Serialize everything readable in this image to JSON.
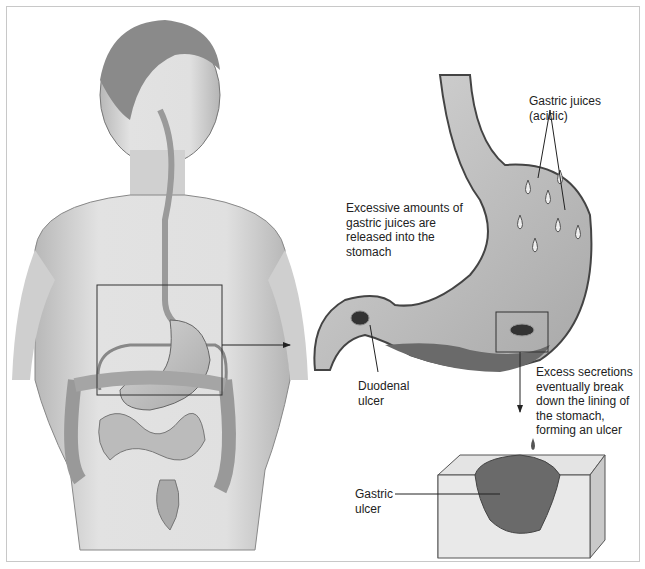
{
  "diagram": {
    "labels": {
      "gastric_juices": [
        "Gastric juices",
        "(acidic)"
      ],
      "excessive_amounts": [
        "Excessive amounts of",
        "gastric juices are",
        "released into the",
        "stomach"
      ],
      "duodenal_ulcer": [
        "Duodenal",
        "ulcer"
      ],
      "excess_secretions": [
        "Excess secretions",
        "eventually break",
        "down the lining of",
        "the stomach,",
        "forming an ulcer"
      ],
      "gastric_ulcer": [
        "Gastric",
        "ulcer"
      ]
    },
    "panels": {
      "body": "human-torso-digestive-system",
      "stomach": "stomach-cross-section",
      "tissue": "stomach-lining-ulcer-block"
    },
    "colors": {
      "ink": "#222222",
      "skin": "#d9d9d9",
      "organ": "#bdbdbd",
      "dark_tissue": "#555555",
      "frame": "#c8c8c8"
    }
  }
}
